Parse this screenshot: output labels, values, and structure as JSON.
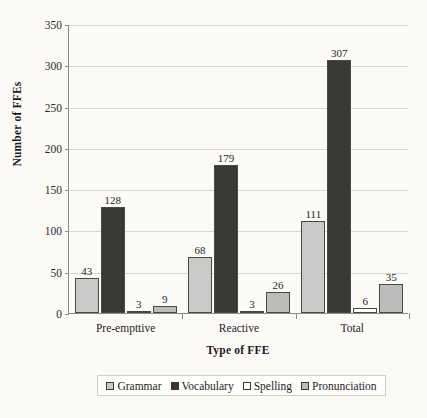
{
  "chart_data": {
    "type": "bar",
    "title": "",
    "xlabel": "Type of FFE",
    "ylabel": "Number of FFEs",
    "categories": [
      "Pre-empttive",
      "Reactive",
      "Total"
    ],
    "series": [
      {
        "name": "Grammar",
        "values": [
          43,
          68,
          111
        ],
        "color": "#c9c9c7"
      },
      {
        "name": "Vocabulary",
        "values": [
          128,
          179,
          307
        ],
        "color": "#3a3834"
      },
      {
        "name": "Spelling",
        "values": [
          3,
          3,
          6
        ],
        "color": "#fdfdfc"
      },
      {
        "name": "Pronunciation",
        "values": [
          9,
          26,
          35
        ],
        "color": "#bcbcba"
      }
    ],
    "ylim": [
      0,
      350
    ],
    "yticks": [
      0,
      50,
      100,
      150,
      200,
      250,
      300,
      350
    ],
    "grid": true,
    "legend_position": "bottom",
    "data_labels": true
  },
  "axis": {
    "y_title": "Number of FFEs",
    "x_title": "Type of FFE",
    "y_tick_labels": [
      "350",
      "300",
      "250",
      "200",
      "150",
      "100",
      "50",
      "0"
    ]
  },
  "legend": {
    "items": [
      {
        "label": "Grammar",
        "color": "#c9c9c7"
      },
      {
        "label": "Vocabulary",
        "color": "#3a3834"
      },
      {
        "label": "Spelling",
        "color": "#fdfdfc"
      },
      {
        "label": "Pronunciation",
        "color": "#bcbcba"
      }
    ]
  }
}
